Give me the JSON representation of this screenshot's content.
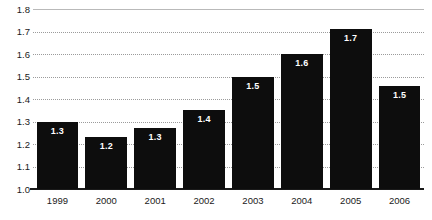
{
  "chart_data": {
    "type": "bar",
    "title": "",
    "subtitle": "",
    "xlabel": "",
    "ylabel": "",
    "categories": [
      "1999",
      "2000",
      "2001",
      "2002",
      "2003",
      "2004",
      "2005",
      "2006"
    ],
    "values": [
      1.3,
      1.2,
      1.3,
      1.4,
      1.5,
      1.6,
      1.7,
      1.5
    ],
    "bar_tops": [
      1.3,
      1.23,
      1.27,
      1.35,
      1.5,
      1.6,
      1.71,
      1.46
    ],
    "data_labels": [
      "1.3",
      "1.2",
      "1.3",
      "1.4",
      "1.5",
      "1.6",
      "1.7",
      "1.5"
    ],
    "ylim": [
      1.0,
      1.8
    ],
    "ytick_step": 0.1,
    "ytick_labels": [
      "1.8",
      "1.7",
      "1.6",
      "1.5",
      "1.4",
      "1.3",
      "1.2",
      "1.1",
      "1.0"
    ],
    "ytick_values": [
      1.8,
      1.7,
      1.6,
      1.5,
      1.4,
      1.3,
      1.2,
      1.1,
      1.0
    ],
    "grid": true,
    "legend": false,
    "legend_position": "none",
    "series": [
      {
        "name": "",
        "values": [
          1.3,
          1.2,
          1.3,
          1.4,
          1.5,
          1.6,
          1.7,
          1.5
        ],
        "color": "#0d0d0d"
      }
    ]
  },
  "colors": {
    "bar": "#0d0d0d",
    "gridline": "#9b9b9b",
    "baseline": "#1a1a1a",
    "tick_text": "#1a1a1a",
    "data_label_text": "#ffffff",
    "background": "#ffffff"
  },
  "clipped_header_text": ""
}
